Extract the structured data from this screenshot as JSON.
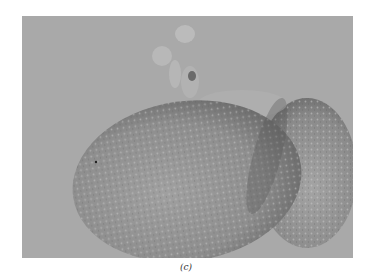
{
  "figure": {
    "caption": "(c)",
    "colors": {
      "background": "#a9a9a9",
      "cell_main": "#8c8c8c",
      "cell_edge": "#6f6f6f",
      "granule": "#c4c4c4",
      "page": "#ffffff"
    }
  }
}
